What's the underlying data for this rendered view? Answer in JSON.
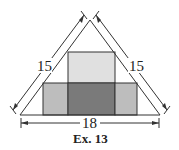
{
  "figure": {
    "caption": "Ex. 13",
    "left_side_label": "15",
    "right_side_label": "15",
    "base_label": "18",
    "colors": {
      "light_rect": "#e0e0e0",
      "medium_rect": "#bdbdbd",
      "dark_rect": "#7a7a7a",
      "stroke": "#333333"
    }
  }
}
